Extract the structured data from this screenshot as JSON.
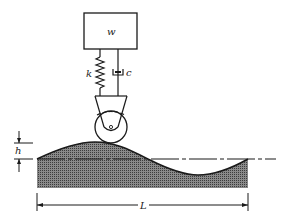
{
  "diagram": {
    "type": "quarter-car suspension over sinusoidal road",
    "mass_label": "w",
    "spring_label": "k",
    "damper_label": "c",
    "height_label": "h",
    "length_label": "L",
    "colors": {
      "stroke": "#1a1a1a",
      "terrain_fill": "#6e6e6e",
      "background": "#ffffff"
    }
  }
}
